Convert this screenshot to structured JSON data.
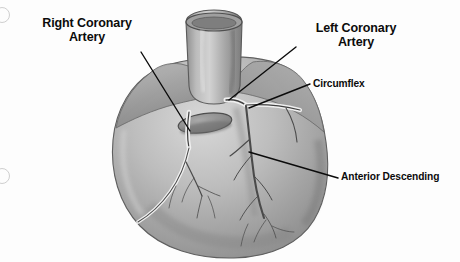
{
  "figure": {
    "kind": "anatomical-illustration",
    "background_color": "#fdfdfd",
    "ink_color": "#0b0b0b",
    "heart_fill_light": "#cfcfcf",
    "heart_fill_mid": "#a8a8a8",
    "heart_fill_dark": "#7d7d7d",
    "vessel_color": "#4a4a4a"
  },
  "labels": {
    "right_coronary_artery": "Right Coronary\nArtery",
    "left_coronary_artery": "Left Coronary\nArtery",
    "circumflex": "Circumflex",
    "anterior_descending": "Anterior Descending"
  },
  "leader_lines": [
    {
      "name": "right-coronary-artery-leader",
      "from": [
        141,
        52
      ],
      "to": [
        190,
        131
      ]
    },
    {
      "name": "left-coronary-artery-leader",
      "from": [
        296,
        47
      ],
      "to": [
        229,
        100
      ]
    },
    {
      "name": "circumflex-leader",
      "from": [
        310,
        84
      ],
      "to": [
        249,
        108
      ]
    },
    {
      "name": "anterior-descending-leader",
      "from": [
        338,
        178
      ],
      "to": [
        249,
        152
      ]
    }
  ],
  "page_marks": {
    "binder_holes": [
      {
        "name": "binder-hole-top",
        "cx": 2,
        "cy": 14,
        "r": 7
      },
      {
        "name": "binder-hole-bottom",
        "cx": 2,
        "cy": 175,
        "r": 7
      }
    ]
  }
}
